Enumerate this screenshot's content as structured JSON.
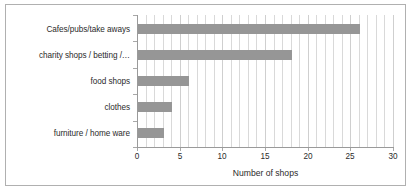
{
  "chart_data": {
    "type": "bar",
    "orientation": "horizontal",
    "title": "",
    "xlabel": "Number of shops",
    "ylabel": "",
    "categories": [
      "Cafes/pubs/take aways",
      "charity shops / betting /…",
      "food shops",
      "clothes",
      "furniture / home ware"
    ],
    "values": [
      26,
      18,
      6,
      4,
      3
    ],
    "xlim": [
      0,
      30
    ],
    "xticks": [
      0,
      5,
      10,
      15,
      20,
      25,
      30
    ],
    "xtick_labels": [
      "0",
      "5",
      "10",
      "15",
      "20",
      "25",
      "30"
    ],
    "minor_gridline_step": 1,
    "grid": true,
    "grid_axis": "x",
    "legend": false,
    "legend_position": "none",
    "series": [
      {
        "name": "Number of shops",
        "values": [
          26,
          18,
          6,
          4,
          3
        ]
      }
    ]
  },
  "style": {
    "bar_color": "#969696",
    "gridline_color": "#d9d9d9",
    "axis_color": "#9a9a9a",
    "text_color": "#2b2b2b",
    "frame_border_color": "#b0b0b0",
    "background": "#ffffff"
  }
}
